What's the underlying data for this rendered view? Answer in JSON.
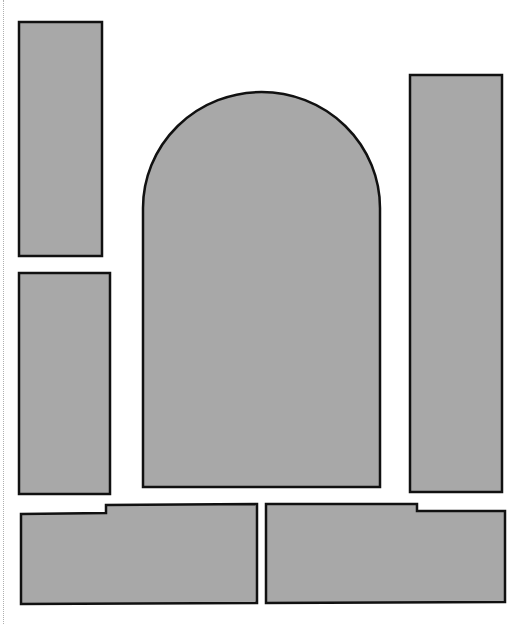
{
  "diagram": {
    "background": "#ffffff",
    "fill": "#a8a8a8",
    "stroke": "#111111",
    "shapes": [
      {
        "id": "rect-top-left",
        "type": "rect"
      },
      {
        "id": "rect-mid-left",
        "type": "rect"
      },
      {
        "id": "arch-center",
        "type": "arch"
      },
      {
        "id": "rect-right",
        "type": "rect"
      },
      {
        "id": "notched-bottom-left",
        "type": "polygon"
      },
      {
        "id": "notched-bottom-right",
        "type": "polygon"
      }
    ]
  }
}
